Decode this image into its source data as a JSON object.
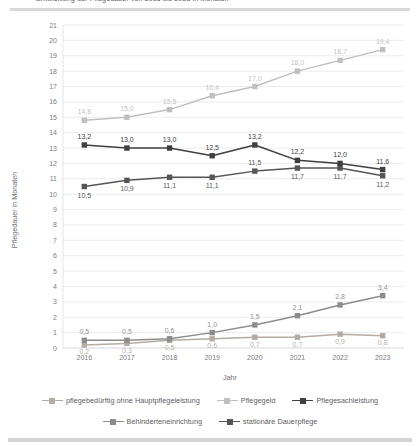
{
  "header": {
    "title_prefix": "Entwicklung der Pflegedauer von 2016 bis 2023 in Monaten",
    "title_accent": ""
  },
  "chart_data": {
    "type": "line",
    "title": "Entwicklung der Pflegedauer von 2016 bis 2023 in Monaten",
    "xlabel": "Jahr",
    "ylabel": "Pflegedauer in Monaten",
    "categories": [
      "2016",
      "2017",
      "2018",
      "2019",
      "2020",
      "2021",
      "2022",
      "2023"
    ],
    "ylim": [
      0,
      21
    ],
    "yticks": [
      0,
      1,
      2,
      3,
      4,
      5,
      6,
      7,
      8,
      9,
      10,
      11,
      12,
      13,
      14,
      15,
      16,
      17,
      18,
      19,
      20,
      21
    ],
    "grid": true,
    "legend_position": "bottom",
    "series": [
      {
        "name": "pflegebedürftig ohne Hauptpflegeleistung",
        "color": "#b4aca4",
        "label_color": "#b9b1a9",
        "values": [
          0.2,
          0.3,
          0.5,
          0.6,
          0.7,
          0.7,
          0.9,
          0.8
        ],
        "labels": [
          "0,2",
          "0,3",
          "0,5",
          "0,6",
          "0,7",
          "0,7",
          "0,9",
          "0,8"
        ]
      },
      {
        "name": "Pflegegeld",
        "color": "#bfbfbf",
        "label_color": "#c4c4c4",
        "values": [
          14.8,
          15.0,
          15.5,
          16.4,
          17.0,
          18.0,
          18.7,
          19.4
        ],
        "labels": [
          "14,8",
          "15,0",
          "15,5",
          "16,4",
          "17,0",
          "18,0",
          "18,7",
          "19,4"
        ]
      },
      {
        "name": "Pflegesachleistung",
        "color": "#3f3f3f",
        "label_color": "#404040",
        "values": [
          13.2,
          13.0,
          13.0,
          12.5,
          13.2,
          12.2,
          12.0,
          11.6
        ],
        "labels": [
          "13,2",
          "13,0",
          "13,0",
          "12,5",
          "13,2",
          "12,2",
          "12,0",
          "11,6"
        ]
      },
      {
        "name": "Behinderteneinrichtung",
        "color": "#8c8c8c",
        "label_color": "#919191",
        "values": [
          0.5,
          0.5,
          0.6,
          1.0,
          1.5,
          2.1,
          2.8,
          3.4
        ],
        "labels": [
          "0,5",
          "0,5",
          "0,6",
          "1,0",
          "1,5",
          "2,1",
          "2,8",
          "3,4"
        ]
      },
      {
        "name": "stationäre Dauerpflege",
        "color": "#555555",
        "label_color": "#585858",
        "values": [
          10.5,
          10.9,
          11.1,
          11.1,
          11.5,
          11.7,
          11.7,
          11.2
        ],
        "labels": [
          "10,5",
          "10,9",
          "11,1",
          "11,1",
          "11,5",
          "11,7",
          "11,7",
          "11,2"
        ]
      }
    ]
  },
  "legend": {
    "rows": [
      [
        {
          "name": "pflegebedürftig ohne Hauptpflegeleistung",
          "color": "#b4aca4"
        },
        {
          "name": "Pflegegeld",
          "color": "#bfbfbf"
        },
        {
          "name": "Pflegesachleistung",
          "color": "#3f3f3f"
        }
      ],
      [
        {
          "name": "Behinderteneinrichtung",
          "color": "#8c8c8c"
        },
        {
          "name": "stationäre Dauerpflege",
          "color": "#555555"
        }
      ]
    ]
  }
}
